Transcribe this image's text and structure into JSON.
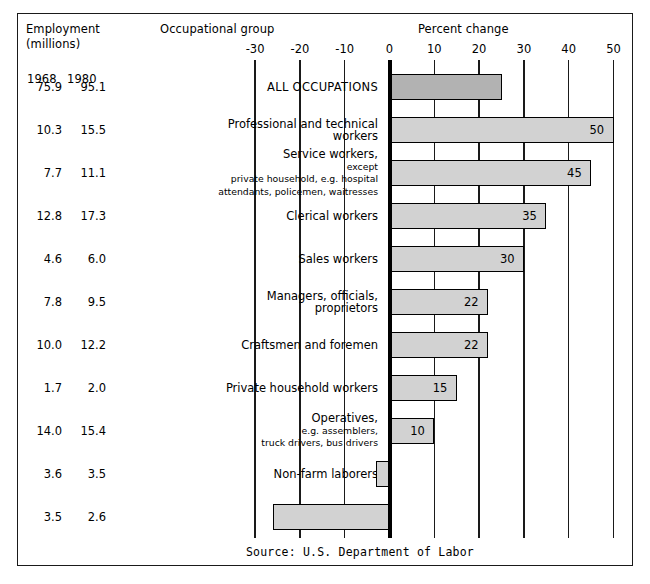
{
  "header": {
    "employment": "Employment",
    "millions": "(millions)",
    "occupational_group": "Occupational group",
    "percent_change": "Percent change",
    "year_1968": "1968",
    "year_1980": "1980"
  },
  "source": "Source:  U.S. Department of Labor",
  "colors": {
    "bar_fill_light": "#d2d2d2",
    "bar_fill_dark": "#b2b2b2",
    "bar_stroke": "#000000",
    "axis": "#1a1a1a",
    "background": "#ffffff"
  },
  "chart_data": {
    "type": "bar",
    "orientation": "horizontal",
    "title": "",
    "xlabel": "Percent change",
    "ylabel": "Occupational group",
    "xlim": [
      -30,
      50
    ],
    "xticks": [
      -30,
      -20,
      -10,
      0,
      10,
      20,
      30,
      40,
      50
    ],
    "xtick_labels": [
      "-30",
      "-20",
      "-10",
      "0",
      "10",
      "20",
      "30",
      "40",
      "50"
    ],
    "grid": true,
    "legend": null,
    "categories": [
      "ALL OCCUPATIONS",
      "Professional and technical workers",
      "Service workers, except private household, e.g. hospital attendants, policemen, waitresses",
      "Clerical workers",
      "Sales workers",
      "Managers, officials, proprietors",
      "Craftsmen and foremen",
      "Private household workers",
      "Operatives, e.g. assemblers, truck drivers, bus drivers",
      "Non-farm laborers",
      "Farm workers"
    ],
    "values": [
      25,
      50,
      45,
      35,
      30,
      22,
      22,
      15,
      10,
      -3,
      -26
    ],
    "value_labels": [
      "",
      "50",
      "45",
      "35",
      "30",
      "22",
      "22",
      "15",
      "10",
      "",
      ""
    ],
    "series": [
      {
        "name": "Employment 1968 (millions)",
        "values": [
          75.9,
          10.3,
          7.7,
          12.8,
          4.6,
          7.8,
          10.0,
          1.7,
          14.0,
          3.6,
          3.5
        ]
      },
      {
        "name": "Employment 1980 (millions)",
        "values": [
          95.1,
          15.5,
          11.1,
          17.3,
          6.0,
          9.5,
          12.2,
          2.0,
          15.4,
          3.5,
          2.6
        ]
      }
    ]
  },
  "rows": [
    {
      "e1968": "75.9",
      "e1980": "95.1",
      "label_main": "ALL OCCUPATIONS",
      "label_sub": "",
      "value": 25,
      "value_label": "",
      "shade": "dark"
    },
    {
      "e1968": "10.3",
      "e1980": "15.5",
      "label_main": "Professional and technical\nworkers",
      "label_sub": "",
      "value": 50,
      "value_label": "50",
      "shade": "light"
    },
    {
      "e1968": "7.7",
      "e1980": "11.1",
      "label_main": "Service workers,",
      "label_sub": " except\nprivate household, e.g. hospital\nattendants, policemen, waitresses",
      "value": 45,
      "value_label": "45",
      "shade": "light"
    },
    {
      "e1968": "12.8",
      "e1980": "17.3",
      "label_main": "Clerical workers",
      "label_sub": "",
      "value": 35,
      "value_label": "35",
      "shade": "light"
    },
    {
      "e1968": "4.6",
      "e1980": "6.0",
      "label_main": "Sales workers",
      "label_sub": "",
      "value": 30,
      "value_label": "30",
      "shade": "light"
    },
    {
      "e1968": "7.8",
      "e1980": "9.5",
      "label_main": "Managers, officials,\nproprietors",
      "label_sub": "",
      "value": 22,
      "value_label": "22",
      "shade": "light"
    },
    {
      "e1968": "10.0",
      "e1980": "12.2",
      "label_main": "Craftsmen and foremen",
      "label_sub": "",
      "value": 22,
      "value_label": "22",
      "shade": "light"
    },
    {
      "e1968": "1.7",
      "e1980": "2.0",
      "label_main": "Private household workers",
      "label_sub": "",
      "value": 15,
      "value_label": "15",
      "shade": "light"
    },
    {
      "e1968": "14.0",
      "e1980": "15.4",
      "label_main": "Operatives,",
      "label_sub": "  e.g. assemblers,\ntruck drivers, bus drivers",
      "value": 10,
      "value_label": "10",
      "shade": "light"
    },
    {
      "e1968": "3.6",
      "e1980": "3.5",
      "label_main": "Non-farm laborers",
      "label_sub": "",
      "value": -3,
      "value_label": "",
      "shade": "light"
    },
    {
      "e1968": "3.5",
      "e1980": "2.6",
      "label_main": "Farm workers",
      "label_sub": "",
      "value": -26,
      "value_label": "",
      "shade": "light"
    }
  ]
}
